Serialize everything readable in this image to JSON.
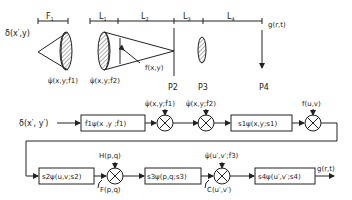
{
  "optical_setup": {
    "input_label": "δ(x′,y)",
    "dimensions": [
      "F1",
      "L1",
      "L2",
      "L3",
      "L4"
    ],
    "phase_labels": [
      "ψ̄(x,y;f̂1)",
      "ψ̄(x,y;f̂2)"
    ],
    "object_label": "f(x,y)",
    "planes": [
      "P2",
      "P3",
      "P4"
    ],
    "output_label": "g(r,t)"
  },
  "block_diagram": {
    "input": "δ(x′, y′)",
    "row1": {
      "block1": "f̂1ψ(x ,y ;f̂1)",
      "mult1_input": "ψ̄(x,y;f̂1)",
      "mult2_input": "ψ̄(x,y;f̂2)",
      "block2": "s1ψ(x,y;s1)",
      "mult3_input": "f(u,v)"
    },
    "row2": {
      "block3": "s2ψ(u,v;s2)",
      "mult4_top": "H(p,q)",
      "mult4_bottom": "F(p,q)",
      "block4": "s3ψ(p,q;s3)",
      "mult5_top": "ψ̄(u′,v′;f̂3)",
      "mult5_bottom": "C(u′,v′)",
      "block5": "s4ψ(u′,v′;s4)",
      "output": "g(r,t)"
    }
  }
}
